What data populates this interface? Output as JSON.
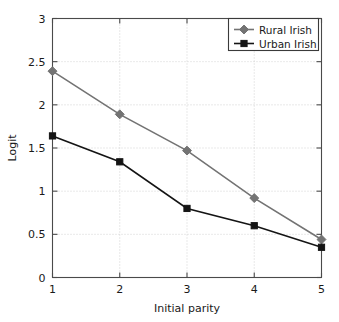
{
  "chart_data": {
    "type": "line",
    "title": "",
    "xlabel": "Initial parity",
    "ylabel": "Logit",
    "x": [
      1,
      2,
      3,
      4,
      5
    ],
    "xticklabels": [
      "1",
      "2",
      "3",
      "4",
      "5"
    ],
    "yticklabels": [
      "0",
      "0.5",
      "1",
      "1.5",
      "2",
      "2.5",
      "3"
    ],
    "yticks": [
      0,
      0.5,
      1,
      1.5,
      2,
      2.5,
      3
    ],
    "xlim": [
      1,
      5
    ],
    "ylim": [
      0,
      3
    ],
    "grid": true,
    "legend_position": "top-right",
    "series": [
      {
        "name": "Rural Irish",
        "values": [
          2.39,
          1.89,
          1.47,
          0.92,
          0.44
        ],
        "color": "#737373",
        "marker": "diamond"
      },
      {
        "name": "Urban Irish",
        "values": [
          1.64,
          1.34,
          0.8,
          0.6,
          0.35
        ],
        "color": "#141414",
        "marker": "square"
      }
    ]
  }
}
